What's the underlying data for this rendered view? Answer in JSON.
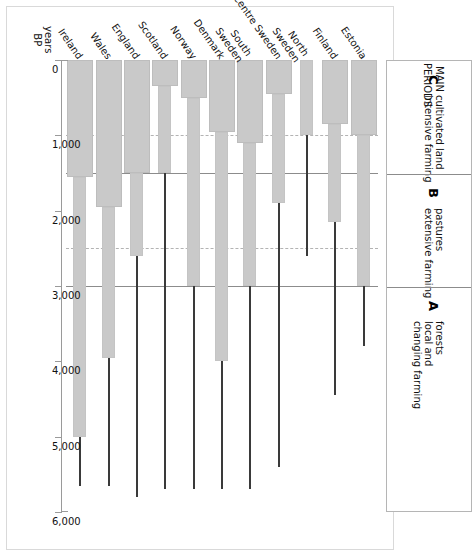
{
  "figure": {
    "axis_title_line1": "years",
    "axis_title_line2": "BP"
  },
  "legend": {
    "title_line1": "MAIN",
    "title_line2": "PERIODS",
    "periods": [
      {
        "letter": "C",
        "line1": "cultivated land",
        "line2": "intensive farming",
        "start": 0,
        "end": 1500
      },
      {
        "letter": "B",
        "line1": "pastures",
        "line2": "extensive farming",
        "start": 1500,
        "end": 3000
      },
      {
        "letter": "A",
        "line1": "forests",
        "line2": "local and",
        "line3": "changing farming",
        "start": 3000,
        "end": 6000
      }
    ]
  },
  "chart_data": {
    "type": "bar",
    "orientation": "horizontal",
    "title": "",
    "xlabel": "years BP",
    "ylabel": "",
    "xlim": [
      0,
      6000
    ],
    "xticks": [
      0,
      1000,
      2000,
      3000,
      4000,
      5000,
      6000
    ],
    "xticklabels": [
      "0",
      "1,000",
      "2,000",
      "3,000",
      "4,000",
      "5,000",
      "6,000"
    ],
    "grid": true,
    "reference_lines": [
      {
        "value": 1000,
        "style": "dashed"
      },
      {
        "value": 1500,
        "style": "solid"
      },
      {
        "value": 2500,
        "style": "dashed"
      },
      {
        "value": 3000,
        "style": "solid"
      }
    ],
    "segment_legend": [
      {
        "name": "cultivated land / intensive farming",
        "style": "thick-bar",
        "color": "#c9c9c9"
      },
      {
        "name": "pastures / extensive farming",
        "style": "medium-bar",
        "color": "#c9c9c9"
      },
      {
        "name": "forests / local and changing farming",
        "style": "thin-line",
        "color": "#3a3a3a"
      }
    ],
    "categories": [
      "Estonia",
      "Finland",
      "North Sweden",
      "Centre Sweden",
      "South Sweden",
      "Denmark",
      "Norway",
      "Scotland",
      "England",
      "Wales",
      "Ireland"
    ],
    "series": [
      {
        "name": "thick (cultivated land / intensive farming)",
        "values": [
          1000,
          850,
          0,
          450,
          1100,
          950,
          500,
          350,
          1500,
          1950,
          1550
        ]
      },
      {
        "name": "medium (pastures / extensive farming)",
        "values": [
          3000,
          2150,
          1000,
          1900,
          3000,
          4000,
          3000,
          1500,
          2600,
          3950,
          5000
        ]
      },
      {
        "name": "thin (forests / local and changing farming)",
        "values": [
          3800,
          4450,
          2600,
          5400,
          5700,
          5700,
          5700,
          5700,
          5800,
          5650,
          5650
        ]
      }
    ]
  }
}
